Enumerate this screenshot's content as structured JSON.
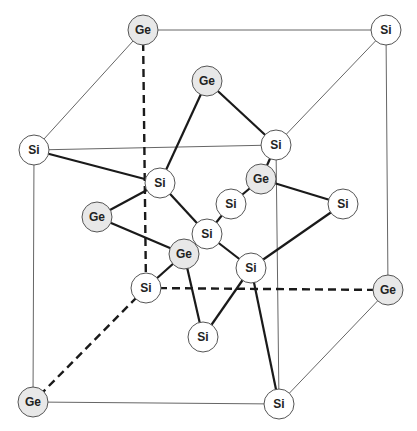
{
  "colors": {
    "si_fill": "#ffffff",
    "ge_fill": "#e8e8e8",
    "outline": "#555555",
    "cell_line": "#666666",
    "bond": "#1a1a1a"
  },
  "atoms": [
    {
      "id": "a0",
      "el": "Ge",
      "x": 143,
      "y": 30
    },
    {
      "id": "a1",
      "el": "Si",
      "x": 386,
      "y": 30
    },
    {
      "id": "a2",
      "el": "Si",
      "x": 34,
      "y": 150
    },
    {
      "id": "a3",
      "el": "Si",
      "x": 276,
      "y": 145
    },
    {
      "id": "a4",
      "el": "Ge",
      "x": 207,
      "y": 81
    },
    {
      "id": "a5",
      "el": "Si",
      "x": 160,
      "y": 183
    },
    {
      "id": "a6",
      "el": "Ge",
      "x": 261,
      "y": 179
    },
    {
      "id": "a7",
      "el": "Si",
      "x": 231,
      "y": 204
    },
    {
      "id": "a8",
      "el": "Si",
      "x": 343,
      "y": 204
    },
    {
      "id": "a9",
      "el": "Ge",
      "x": 97,
      "y": 217
    },
    {
      "id": "a10",
      "el": "Si",
      "x": 207,
      "y": 234
    },
    {
      "id": "a11",
      "el": "Ge",
      "x": 184,
      "y": 254
    },
    {
      "id": "a12",
      "el": "Si",
      "x": 251,
      "y": 268
    },
    {
      "id": "a13",
      "el": "Si",
      "x": 146,
      "y": 288
    },
    {
      "id": "a14",
      "el": "Ge",
      "x": 388,
      "y": 290
    },
    {
      "id": "a15",
      "el": "Si",
      "x": 203,
      "y": 337
    },
    {
      "id": "a16",
      "el": "Ge",
      "x": 33,
      "y": 402
    },
    {
      "id": "a17",
      "el": "Si",
      "x": 279,
      "y": 404
    }
  ],
  "cell_edges_solid": [
    [
      "a0",
      "a1"
    ],
    [
      "a0",
      "a2"
    ],
    [
      "a1",
      "a3"
    ],
    [
      "a2",
      "a3"
    ],
    [
      "a1",
      "a14"
    ],
    [
      "a2",
      "a16"
    ],
    [
      "a3",
      "a17"
    ],
    [
      "a16",
      "a17"
    ],
    [
      "a14",
      "a17"
    ]
  ],
  "cell_edges_dashed": [
    [
      "a0",
      "a13"
    ],
    [
      "a13",
      "a14"
    ],
    [
      "a13",
      "a16"
    ]
  ],
  "bonds": [
    [
      "a2",
      "a5"
    ],
    [
      "a4",
      "a5"
    ],
    [
      "a4",
      "a3"
    ],
    [
      "a3",
      "a6"
    ],
    [
      "a5",
      "a9"
    ],
    [
      "a5",
      "a10"
    ],
    [
      "a6",
      "a7"
    ],
    [
      "a6",
      "a8"
    ],
    [
      "a7",
      "a10"
    ],
    [
      "a9",
      "a11"
    ],
    [
      "a10",
      "a11"
    ],
    [
      "a10",
      "a12"
    ],
    [
      "a8",
      "a12"
    ],
    [
      "a11",
      "a13"
    ],
    [
      "a11",
      "a15"
    ],
    [
      "a12",
      "a15"
    ],
    [
      "a12",
      "a17"
    ]
  ],
  "atom_radius": 15
}
